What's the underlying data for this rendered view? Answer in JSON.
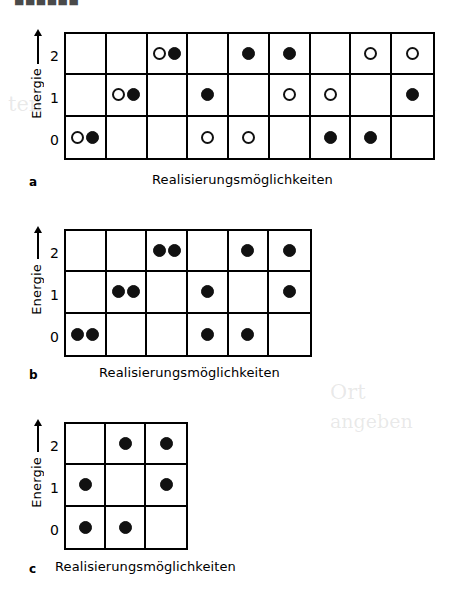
{
  "figure": {
    "top_fragment": "■■■■■■",
    "axis_label": "Energie",
    "tick_labels": [
      "2",
      "1",
      "0"
    ],
    "caption_text": "Realisierungsmöglichkeiten",
    "ink_color": "#111111",
    "background_color": "#ffffff"
  },
  "panels": [
    {
      "letter": "a",
      "caption": "Realisierungsmöglichkeiten",
      "columns": 9,
      "rows": 3,
      "row_labels": [
        "2",
        "1",
        "0"
      ],
      "cells": [
        [
          [],
          [],
          [
            "open",
            "filled"
          ],
          [],
          [
            "filled"
          ],
          [
            "filled"
          ],
          [],
          [
            "open"
          ],
          [
            "open"
          ]
        ],
        [
          [],
          [
            "open",
            "filled"
          ],
          [],
          [
            "filled"
          ],
          [],
          [
            "open"
          ],
          [
            "open"
          ],
          [],
          [
            "filled"
          ]
        ],
        [
          [
            "open",
            "filled"
          ],
          [],
          [],
          [
            "open"
          ],
          [
            "open"
          ],
          [],
          [
            "filled"
          ],
          [
            "filled"
          ],
          []
        ]
      ]
    },
    {
      "letter": "b",
      "caption": "Realisierungsmöglichkeiten",
      "columns": 6,
      "rows": 3,
      "row_labels": [
        "2",
        "1",
        "0"
      ],
      "cells": [
        [
          [],
          [],
          [
            "filled",
            "filled"
          ],
          [],
          [
            "filled"
          ],
          [
            "filled"
          ]
        ],
        [
          [],
          [
            "filled",
            "filled"
          ],
          [],
          [
            "filled"
          ],
          [],
          [
            "filled"
          ]
        ],
        [
          [
            "filled",
            "filled"
          ],
          [],
          [],
          [
            "filled"
          ],
          [
            "filled"
          ],
          []
        ]
      ]
    },
    {
      "letter": "c",
      "caption": "Realisierungsmöglichkeiten",
      "columns": 3,
      "rows": 3,
      "row_labels": [
        "2",
        "1",
        "0"
      ],
      "cells": [
        [
          [],
          [
            "filled"
          ],
          [
            "filled"
          ]
        ],
        [
          [
            "filled"
          ],
          [],
          [
            "filled"
          ]
        ],
        [
          [
            "filled"
          ],
          [
            "filled"
          ],
          []
        ]
      ]
    }
  ],
  "ghost_text": [
    "ten",
    "Verteilungen",
    "alle",
    "Ort",
    "angeben",
    "nur",
    "auf",
    "und"
  ]
}
